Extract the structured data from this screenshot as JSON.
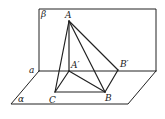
{
  "diagram": {
    "type": "solid-geometry",
    "planes": [
      {
        "name": "beta",
        "label": "β"
      },
      {
        "name": "alpha",
        "label": "α"
      }
    ],
    "line_label": "a",
    "points": {
      "A": {
        "label": "A",
        "x": 69,
        "y": 21
      },
      "A_prime": {
        "label": "A′",
        "x": 69,
        "y": 71
      },
      "B_prime": {
        "label": "B′",
        "x": 118,
        "y": 70
      },
      "B": {
        "label": "B",
        "x": 105,
        "y": 92
      },
      "C": {
        "label": "C",
        "x": 55,
        "y": 92
      }
    },
    "segments": [
      "AA′",
      "AB",
      "AC",
      "AB′",
      "A′B",
      "A′C",
      "CB",
      "B′B"
    ],
    "colors": {
      "stroke": "#222222",
      "background": "#ffffff"
    }
  }
}
